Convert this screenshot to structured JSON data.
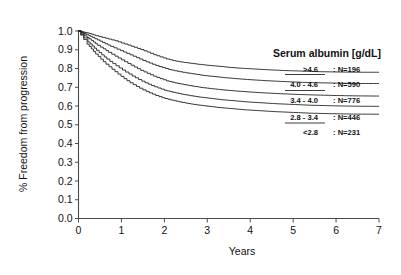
{
  "chart_data": {
    "type": "line",
    "title": "",
    "xlabel": "Years",
    "ylabel": "% Freedom from progression",
    "xlim": [
      0,
      7
    ],
    "ylim": [
      0.0,
      1.0
    ],
    "xticks": [
      "0",
      "1",
      "2",
      "3",
      "4",
      "5",
      "6",
      "7"
    ],
    "yticks": [
      "0.0",
      "0.1",
      "0.2",
      "0.3",
      "0.4",
      "0.5",
      "0.6",
      "0.7",
      "0.8",
      "0.9",
      "1.0"
    ],
    "grid": false,
    "legend_position": "upper-right-inside",
    "legend_title": "Serum albumin [g/dL]",
    "curve_style": "kaplan-meier step",
    "series": [
      {
        "name": ">4.6",
        "n_label": ": N=196",
        "n": 196,
        "color": "#1a1a1a",
        "points": [
          [
            0.0,
            1.0
          ],
          [
            0.1,
            0.995
          ],
          [
            0.2,
            0.99
          ],
          [
            0.3,
            0.983
          ],
          [
            0.4,
            0.975
          ],
          [
            0.55,
            0.966
          ],
          [
            0.7,
            0.957
          ],
          [
            0.85,
            0.948
          ],
          [
            1.0,
            0.936
          ],
          [
            1.15,
            0.925
          ],
          [
            1.3,
            0.913
          ],
          [
            1.45,
            0.901
          ],
          [
            1.6,
            0.888
          ],
          [
            1.75,
            0.874
          ],
          [
            1.9,
            0.862
          ],
          [
            2.05,
            0.851
          ],
          [
            2.2,
            0.842
          ],
          [
            2.4,
            0.834
          ],
          [
            2.6,
            0.828
          ],
          [
            2.8,
            0.822
          ],
          [
            3.0,
            0.817
          ],
          [
            3.25,
            0.812
          ],
          [
            3.5,
            0.806
          ],
          [
            3.8,
            0.801
          ],
          [
            4.1,
            0.797
          ],
          [
            4.4,
            0.793
          ],
          [
            4.8,
            0.789
          ],
          [
            5.2,
            0.786
          ],
          [
            5.6,
            0.783
          ],
          [
            6.1,
            0.781
          ],
          [
            6.6,
            0.78
          ],
          [
            7.0,
            0.78
          ]
        ]
      },
      {
        "name": "4.0 - 4.6",
        "n_label": ": N=590",
        "n": 590,
        "color": "#1a1a1a",
        "points": [
          [
            0.0,
            1.0
          ],
          [
            0.08,
            0.992
          ],
          [
            0.18,
            0.982
          ],
          [
            0.28,
            0.971
          ],
          [
            0.38,
            0.959
          ],
          [
            0.5,
            0.946
          ],
          [
            0.62,
            0.932
          ],
          [
            0.75,
            0.918
          ],
          [
            0.9,
            0.903
          ],
          [
            1.05,
            0.888
          ],
          [
            1.2,
            0.873
          ],
          [
            1.35,
            0.858
          ],
          [
            1.5,
            0.843
          ],
          [
            1.65,
            0.829
          ],
          [
            1.8,
            0.816
          ],
          [
            1.95,
            0.805
          ],
          [
            2.1,
            0.795
          ],
          [
            2.3,
            0.785
          ],
          [
            2.5,
            0.777
          ],
          [
            2.7,
            0.77
          ],
          [
            2.9,
            0.763
          ],
          [
            3.15,
            0.757
          ],
          [
            3.4,
            0.751
          ],
          [
            3.7,
            0.745
          ],
          [
            4.0,
            0.74
          ],
          [
            4.35,
            0.735
          ],
          [
            4.7,
            0.731
          ],
          [
            5.1,
            0.727
          ],
          [
            5.5,
            0.724
          ],
          [
            6.0,
            0.722
          ],
          [
            6.5,
            0.72
          ],
          [
            7.0,
            0.72
          ]
        ]
      },
      {
        "name": "3.4 - 4.0",
        "n_label": ": N=776",
        "n": 776,
        "color": "#1a1a1a",
        "points": [
          [
            0.0,
            1.0
          ],
          [
            0.07,
            0.988
          ],
          [
            0.15,
            0.974
          ],
          [
            0.25,
            0.958
          ],
          [
            0.35,
            0.941
          ],
          [
            0.45,
            0.923
          ],
          [
            0.58,
            0.905
          ],
          [
            0.7,
            0.886
          ],
          [
            0.85,
            0.866
          ],
          [
            1.0,
            0.846
          ],
          [
            1.15,
            0.827
          ],
          [
            1.3,
            0.808
          ],
          [
            1.45,
            0.79
          ],
          [
            1.6,
            0.774
          ],
          [
            1.75,
            0.759
          ],
          [
            1.9,
            0.746
          ],
          [
            2.05,
            0.734
          ],
          [
            2.25,
            0.723
          ],
          [
            2.45,
            0.714
          ],
          [
            2.65,
            0.706
          ],
          [
            2.85,
            0.699
          ],
          [
            3.1,
            0.692
          ],
          [
            3.35,
            0.686
          ],
          [
            3.65,
            0.68
          ],
          [
            3.95,
            0.675
          ],
          [
            4.3,
            0.67
          ],
          [
            4.65,
            0.666
          ],
          [
            5.05,
            0.662
          ],
          [
            5.45,
            0.659
          ],
          [
            5.95,
            0.656
          ],
          [
            6.45,
            0.654
          ],
          [
            7.0,
            0.653
          ]
        ]
      },
      {
        "name": "2.8 - 3.4",
        "n_label": ": N=446",
        "n": 446,
        "color": "#1a1a1a",
        "points": [
          [
            0.0,
            1.0
          ],
          [
            0.06,
            0.982
          ],
          [
            0.13,
            0.963
          ],
          [
            0.22,
            0.942
          ],
          [
            0.32,
            0.92
          ],
          [
            0.42,
            0.897
          ],
          [
            0.54,
            0.873
          ],
          [
            0.66,
            0.85
          ],
          [
            0.8,
            0.826
          ],
          [
            0.95,
            0.803
          ],
          [
            1.1,
            0.781
          ],
          [
            1.25,
            0.76
          ],
          [
            1.4,
            0.741
          ],
          [
            1.55,
            0.724
          ],
          [
            1.7,
            0.709
          ],
          [
            1.85,
            0.696
          ],
          [
            2.0,
            0.684
          ],
          [
            2.2,
            0.673
          ],
          [
            2.4,
            0.663
          ],
          [
            2.6,
            0.655
          ],
          [
            2.8,
            0.648
          ],
          [
            3.05,
            0.641
          ],
          [
            3.3,
            0.634
          ],
          [
            3.6,
            0.628
          ],
          [
            3.9,
            0.622
          ],
          [
            4.25,
            0.617
          ],
          [
            4.6,
            0.612
          ],
          [
            5.0,
            0.608
          ],
          [
            5.4,
            0.604
          ],
          [
            5.9,
            0.601
          ],
          [
            6.4,
            0.599
          ],
          [
            7.0,
            0.598
          ]
        ]
      },
      {
        "name": "<2.8",
        "n_label": ": N=231",
        "n": 231,
        "color": "#1a1a1a",
        "points": [
          [
            0.0,
            1.0
          ],
          [
            0.05,
            0.978
          ],
          [
            0.12,
            0.955
          ],
          [
            0.2,
            0.93
          ],
          [
            0.3,
            0.904
          ],
          [
            0.4,
            0.877
          ],
          [
            0.52,
            0.85
          ],
          [
            0.64,
            0.823
          ],
          [
            0.78,
            0.796
          ],
          [
            0.92,
            0.77
          ],
          [
            1.06,
            0.746
          ],
          [
            1.2,
            0.724
          ],
          [
            1.35,
            0.704
          ],
          [
            1.5,
            0.686
          ],
          [
            1.65,
            0.67
          ],
          [
            1.8,
            0.656
          ],
          [
            1.95,
            0.644
          ],
          [
            2.15,
            0.632
          ],
          [
            2.35,
            0.622
          ],
          [
            2.55,
            0.613
          ],
          [
            2.75,
            0.606
          ],
          [
            3.0,
            0.599
          ],
          [
            3.25,
            0.592
          ],
          [
            3.55,
            0.586
          ],
          [
            3.85,
            0.58
          ],
          [
            4.2,
            0.575
          ],
          [
            4.55,
            0.57
          ],
          [
            4.95,
            0.566
          ],
          [
            5.35,
            0.562
          ],
          [
            5.85,
            0.559
          ],
          [
            6.35,
            0.557
          ],
          [
            7.0,
            0.556
          ]
        ]
      }
    ]
  },
  "legend": {
    "title": "Serum albumin [g/dL]",
    "entries": [
      {
        "range": ">4.6",
        "count": ": N=196"
      },
      {
        "range": "4.0 - 4.6",
        "count": ": N=590"
      },
      {
        "range": "3.4 - 4.0",
        "count": ": N=776"
      },
      {
        "range": "2.8 - 3.4",
        "count": ": N=446"
      },
      {
        "range": "<2.8",
        "count": ": N=231"
      }
    ]
  },
  "axes": {
    "y_title": "% Freedom from progression",
    "x_title": "Years",
    "y_ticks": [
      "1.0",
      "0.9",
      "0.8",
      "0.7",
      "0.6",
      "0.5",
      "0.4",
      "0.3",
      "0.2",
      "0.1",
      "0.0"
    ],
    "x_ticks": [
      "0",
      "1",
      "2",
      "3",
      "4",
      "5",
      "6",
      "7"
    ]
  },
  "colors": {
    "curve": "#1a1a1a",
    "axis": "#4a4a4a",
    "background": "#ffffff",
    "text": "#111111"
  }
}
